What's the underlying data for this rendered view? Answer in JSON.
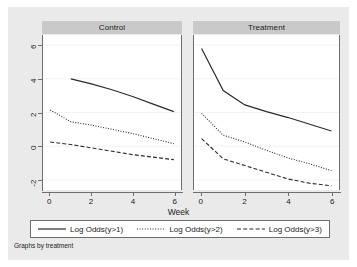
{
  "chart_data": {
    "type": "line",
    "title": "",
    "xlabel": "Week",
    "ylabel": "",
    "footnote": "Graphs by treatment",
    "grid": true,
    "legend_position": "bottom",
    "xlim": [
      -0.35,
      6.35
    ],
    "ylim": [
      -2.6,
      6.6
    ],
    "xticks": [
      0,
      2,
      4,
      6
    ],
    "yticks": [
      6,
      4,
      2,
      0,
      -2
    ],
    "ytick_labels": [
      "6",
      "4",
      "2",
      "0",
      "-2"
    ],
    "xtick_labels": [
      "0",
      "2",
      "4",
      "6"
    ],
    "panels": [
      {
        "name": "Control",
        "x": [
          0,
          1,
          2,
          3,
          4,
          5,
          6
        ],
        "series": [
          {
            "name": "Log Odds(y>1)",
            "style": "solid",
            "x": [
              1,
              2,
              3,
              4,
              5,
              6
            ],
            "values": [
              4.0,
              3.7,
              3.35,
              2.95,
              2.5,
              2.05
            ]
          },
          {
            "name": "Log Odds(y>2)",
            "style": "dotted",
            "x": [
              0,
              1,
              2,
              3,
              4,
              5,
              6
            ],
            "values": [
              2.15,
              1.45,
              1.25,
              1.0,
              0.75,
              0.45,
              0.15
            ]
          },
          {
            "name": "Log Odds(y>3)",
            "style": "dashed",
            "x": [
              0,
              1,
              2,
              3,
              4,
              5,
              6
            ],
            "values": [
              0.25,
              0.1,
              -0.1,
              -0.3,
              -0.5,
              -0.65,
              -0.8
            ]
          }
        ]
      },
      {
        "name": "Treatment",
        "x": [
          0,
          1,
          2,
          3,
          4,
          5,
          6
        ],
        "series": [
          {
            "name": "Log Odds(y>1)",
            "style": "solid",
            "x": [
              0,
              1,
              2,
              3,
              4,
              5,
              6
            ],
            "values": [
              5.8,
              3.3,
              2.45,
              2.05,
              1.7,
              1.3,
              0.9
            ]
          },
          {
            "name": "Log Odds(y>2)",
            "style": "dotted",
            "x": [
              0,
              1,
              2,
              3,
              4,
              5,
              6
            ],
            "values": [
              1.95,
              0.65,
              0.25,
              -0.25,
              -0.7,
              -1.05,
              -1.45
            ]
          },
          {
            "name": "Log Odds(y>3)",
            "style": "dashed",
            "x": [
              0,
              1,
              2,
              3,
              4,
              5,
              6
            ],
            "values": [
              0.45,
              -0.75,
              -1.15,
              -1.55,
              -1.95,
              -2.2,
              -2.35
            ]
          }
        ]
      }
    ],
    "legend": [
      {
        "label": "Log Odds(y>1)",
        "style": "solid"
      },
      {
        "label": "Log Odds(y>2)",
        "style": "dotted"
      },
      {
        "label": "Log Odds(y>3)",
        "style": "dashed"
      }
    ],
    "colors": {
      "line": "#2b2b2b",
      "panel_title_bg": "#c9c9c9",
      "figure_bg": "#eaeaea",
      "plot_bg": "#ffffff",
      "axis": "#6e6e6e",
      "grid": "#f2f2f2"
    }
  }
}
